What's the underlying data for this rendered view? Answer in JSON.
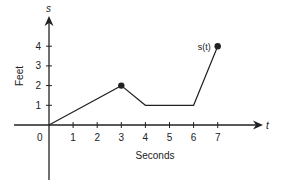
{
  "chart_data": {
    "type": "line",
    "title": "",
    "xlabel": "Seconds",
    "ylabel": "Feet",
    "x_axis_var": "t",
    "y_axis_var": "s",
    "series": [
      {
        "name": "s(t)",
        "x": [
          0,
          3,
          4,
          6,
          7
        ],
        "y": [
          0,
          2,
          1,
          1,
          4
        ],
        "marked_points": [
          [
            3,
            2
          ],
          [
            7,
            4
          ]
        ]
      }
    ],
    "x_ticks": [
      "1",
      "2",
      "3",
      "4",
      "5",
      "6",
      "7"
    ],
    "y_ticks": [
      "1",
      "2",
      "3",
      "4"
    ],
    "origin_label": "0",
    "xlim": [
      0,
      8.5
    ],
    "ylim": [
      0,
      5
    ],
    "grid": false,
    "legend": "none",
    "annotations": [
      {
        "text": "s(t)",
        "x": 7,
        "y": 4
      }
    ]
  },
  "colors": {
    "line": "#222222",
    "axis": "#222222"
  }
}
